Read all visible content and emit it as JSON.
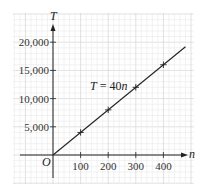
{
  "chart_data": {
    "type": "line",
    "title": "",
    "xlabel": "n",
    "ylabel": "T",
    "origin_label": "O",
    "x_ticks": [
      100,
      200,
      300,
      400
    ],
    "x_tick_labels": [
      "100",
      "200",
      "300",
      "400"
    ],
    "y_ticks": [
      5000,
      10000,
      15000,
      20000
    ],
    "y_tick_labels": [
      "5,000",
      "10,000",
      "15,000",
      "20,000"
    ],
    "xlim": [
      -170,
      480
    ],
    "ylim": [
      -5000,
      20800
    ],
    "grid": true,
    "series": [
      {
        "name": "T = 40n",
        "equation": "T = 40n",
        "x": [
          0,
          480
        ],
        "y": [
          0,
          19200
        ]
      }
    ],
    "marked_points": [
      {
        "x": 100,
        "y": 4000
      },
      {
        "x": 200,
        "y": 8000
      },
      {
        "x": 300,
        "y": 12000
      },
      {
        "x": 400,
        "y": 16000
      }
    ],
    "annotation": {
      "text_italic_1": "T",
      "text_mid": " = 40",
      "text_italic_2": "n"
    }
  },
  "colors": {
    "grid_minor": "#ececec",
    "grid_major": "#d4d4d4",
    "axis": "#222222",
    "line": "#222222"
  }
}
